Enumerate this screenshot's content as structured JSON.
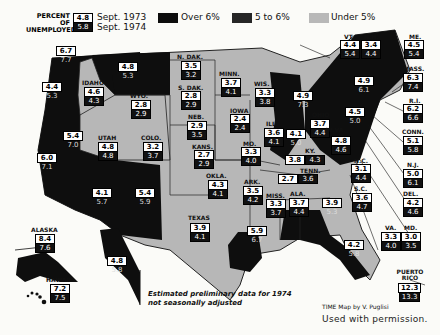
{
  "legend": {
    "title_line1": "PERCENT OF",
    "title_line2": "UNEMPLOYED",
    "sample_1973": "4.8",
    "sample_1974": "5.8",
    "year1_label": "Sept. 1973",
    "year2_label": "Sept. 1974",
    "categories": [
      {
        "label": "Over 6%",
        "color": "#0d0d0d"
      },
      {
        "label": "5 to 6%",
        "color": "#262626"
      },
      {
        "label": "Under 5%",
        "color": "#b8b8b8"
      }
    ]
  },
  "states": [
    {
      "id": "wa",
      "name": "",
      "v1973": "6.7",
      "v1974": "7.7",
      "fill": "dark"
    },
    {
      "id": "or",
      "name": "",
      "v1973": "4.4",
      "v1974": "5.3",
      "fill": "dark"
    },
    {
      "id": "ca",
      "name": "",
      "v1973": "6.0",
      "v1974": "7.1",
      "fill": "dark"
    },
    {
      "id": "nv",
      "name": "",
      "v1973": "5.4",
      "v1974": "7.0",
      "fill": "dark"
    },
    {
      "id": "id",
      "name": "IDAHO",
      "v1973": "4.6",
      "v1974": "4.3",
      "fill": "light"
    },
    {
      "id": "mt",
      "name": "",
      "v1973": "4.8",
      "v1974": "5.3",
      "fill": "dark"
    },
    {
      "id": "wy",
      "name": "WYO.",
      "v1973": "2.8",
      "v1974": "2.9",
      "fill": "light"
    },
    {
      "id": "ut",
      "name": "UTAH",
      "v1973": "4.8",
      "v1974": "4.8",
      "fill": "light"
    },
    {
      "id": "co",
      "name": "COLO.",
      "v1973": "3.2",
      "v1974": "3.7",
      "fill": "light"
    },
    {
      "id": "az",
      "name": "",
      "v1973": "4.1",
      "v1974": "5.7",
      "fill": "dark"
    },
    {
      "id": "nm",
      "name": "",
      "v1973": "5.4",
      "v1974": "5.9",
      "fill": "dark"
    },
    {
      "id": "nd",
      "name": "N. DAK.",
      "v1973": "3.5",
      "v1974": "3.2",
      "fill": "light"
    },
    {
      "id": "sd",
      "name": "S. DAK.",
      "v1973": "2.8",
      "v1974": "2.9",
      "fill": "light"
    },
    {
      "id": "ne",
      "name": "NEB.",
      "v1973": "2.9",
      "v1974": "3.5",
      "fill": "light"
    },
    {
      "id": "ks",
      "name": "KANS.",
      "v1973": "2.7",
      "v1974": "2.9",
      "fill": "light"
    },
    {
      "id": "ok",
      "name": "OKLA.",
      "v1973": "4.3",
      "v1974": "4.1",
      "fill": "light"
    },
    {
      "id": "tx",
      "name": "TEXAS",
      "v1973": "3.9",
      "v1974": "4.1",
      "fill": "light"
    },
    {
      "id": "mn",
      "name": "MINN.",
      "v1973": "3.7",
      "v1974": "4.1",
      "fill": "light"
    },
    {
      "id": "ia",
      "name": "IOWA",
      "v1973": "2.4",
      "v1974": "2.4",
      "fill": "light"
    },
    {
      "id": "mo",
      "name": "MO.",
      "v1973": "3.3",
      "v1974": "4.0",
      "fill": "light"
    },
    {
      "id": "ar",
      "name": "ARK.",
      "v1973": "3.5",
      "v1974": "4.2",
      "fill": "light"
    },
    {
      "id": "la",
      "name": "",
      "v1973": "5.9",
      "v1974": "6.7",
      "fill": "dark"
    },
    {
      "id": "wi",
      "name": "WIS.",
      "v1973": "3.3",
      "v1974": "3.8",
      "fill": "light"
    },
    {
      "id": "il",
      "name": "ILL.",
      "v1973": "3.6",
      "v1974": "4.1",
      "fill": "light"
    },
    {
      "id": "mi",
      "name": "",
      "v1973": "4.9",
      "v1974": "7.3",
      "fill": "dark"
    },
    {
      "id": "in",
      "name": "",
      "v1973": "4.1",
      "v1974": "5.0",
      "fill": "dark"
    },
    {
      "id": "oh",
      "name": "OHIO",
      "v1973": "3.7",
      "v1974": "4.4",
      "fill": "light"
    },
    {
      "id": "ky",
      "name": "KY.",
      "v1973": "3.8",
      "v1974": "4.3",
      "fill": "light"
    },
    {
      "id": "tn",
      "name": "TENN.",
      "v1973": "2.7",
      "v1974": "3.6",
      "fill": "light"
    },
    {
      "id": "ms",
      "name": "MISS.",
      "v1973": "3.3",
      "v1974": "3.7",
      "fill": "light"
    },
    {
      "id": "al",
      "name": "ALA.",
      "v1973": "3.7",
      "v1974": "4.4",
      "fill": "light"
    },
    {
      "id": "ga",
      "name": "",
      "v1973": "3.9",
      "v1974": "5.3",
      "fill": "dark"
    },
    {
      "id": "fl",
      "name": "",
      "v1973": "4.2",
      "v1974": "5.8",
      "fill": "dark"
    },
    {
      "id": "sc",
      "name": "S.C.",
      "v1973": "3.6",
      "v1974": "4.7",
      "fill": "light"
    },
    {
      "id": "nc",
      "name": "N.C.",
      "v1973": "3.1",
      "v1974": "4.4",
      "fill": "light"
    },
    {
      "id": "wv",
      "name": "W.VA.",
      "v1973": "4.8",
      "v1974": "4.6",
      "fill": "light"
    },
    {
      "id": "va",
      "name": "VA.",
      "v1973": "3.3",
      "v1974": "4.0",
      "fill": "light"
    },
    {
      "id": "md",
      "name": "MD.",
      "v1973": "3.0",
      "v1974": "3.5",
      "fill": "light"
    },
    {
      "id": "de",
      "name": "DEL.",
      "v1973": "4.2",
      "v1974": "4.6",
      "fill": "light"
    },
    {
      "id": "nj",
      "name": "N.J.",
      "v1973": "5.0",
      "v1974": "6.1",
      "fill": "dark"
    },
    {
      "id": "pa",
      "name": "",
      "v1973": "4.5",
      "v1974": "5.0",
      "fill": "dark"
    },
    {
      "id": "ny",
      "name": "",
      "v1973": "4.9",
      "v1974": "6.1",
      "fill": "dark"
    },
    {
      "id": "ct",
      "name": "CONN.",
      "v1973": "5.1",
      "v1974": "5.8",
      "fill": "dark"
    },
    {
      "id": "ri",
      "name": "R.I.",
      "v1973": "6.2",
      "v1974": "6.6",
      "fill": "dark"
    },
    {
      "id": "ma",
      "name": "MASS.",
      "v1973": "6.3",
      "v1974": "7.4",
      "fill": "dark"
    },
    {
      "id": "vt",
      "name": "VT.",
      "v1973": "4.4",
      "v1974": "5.4",
      "fill": "dark"
    },
    {
      "id": "nh",
      "name": "N.H.",
      "v1973": "3.4",
      "v1974": "4.4",
      "fill": "light"
    },
    {
      "id": "me",
      "name": "ME.",
      "v1973": "4.5",
      "v1974": "5.4",
      "fill": "dark"
    },
    {
      "id": "ak",
      "name": "ALASKA",
      "v1973": "8.4",
      "v1974": "7.6",
      "fill": "dark"
    },
    {
      "id": "hi",
      "name": "HAWAII",
      "v1973": "7.2",
      "v1974": "7.5",
      "fill": "dark"
    },
    {
      "id": "pr",
      "name": "PUERTO RICO",
      "v1973": "12.3",
      "v1974": "13.3",
      "fill": "dark"
    },
    {
      "id": "baja",
      "name": "",
      "v1973": "4.8",
      "v1974": "5.8",
      "fill": "dark"
    }
  ],
  "footnote_line1": "Estimated preliminary data for 1974",
  "footnote_line2": "not seasonally adjusted",
  "credit": "TIME Map by V. Puglisi",
  "permission": "Used with permission."
}
